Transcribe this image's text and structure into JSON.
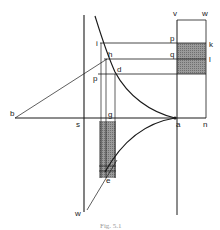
{
  "figure": {
    "caption": "Fig. 5.1",
    "colors": {
      "line": "#1a1a1a",
      "shade": "#8a8a8a",
      "background": "#ffffff"
    },
    "labels": {
      "v": "v",
      "w_top": "w",
      "p_top": "p",
      "k": "k",
      "q": "q",
      "l": "l",
      "i": "i",
      "h": "h",
      "d": "d",
      "p_left": "p",
      "b": "b",
      "s": "s",
      "g": "g",
      "a": "a",
      "n": "n",
      "e": "e",
      "w_bottom": "w"
    }
  }
}
